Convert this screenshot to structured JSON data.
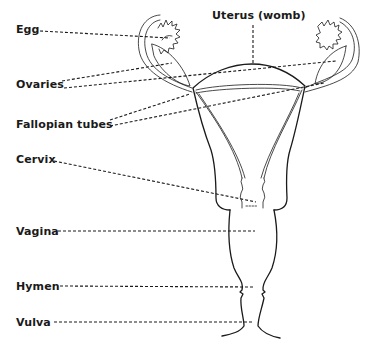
{
  "diagram": {
    "type": "anatomy-labeled",
    "colors": {
      "ink": "#1a1a1a",
      "background": "#ffffff"
    },
    "labels": [
      {
        "id": "egg",
        "text": "Egg"
      },
      {
        "id": "uterus",
        "text": "Uterus (womb)"
      },
      {
        "id": "ovaries",
        "text": "Ovaries"
      },
      {
        "id": "fallopian_tubes",
        "text": "Fallopian tubes"
      },
      {
        "id": "cervix",
        "text": "Cervix"
      },
      {
        "id": "vagina",
        "text": "Vagina"
      },
      {
        "id": "hymen",
        "text": "Hymen"
      },
      {
        "id": "vulva",
        "text": "Vulva"
      }
    ]
  }
}
